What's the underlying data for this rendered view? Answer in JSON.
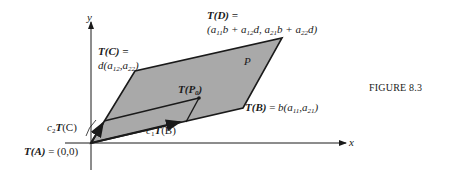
{
  "figure": {
    "caption": "FIGURE 8.3",
    "axes": {
      "x_label": "x",
      "y_label": "y"
    },
    "region_label": "P",
    "colors": {
      "fill": "#a9a9a9",
      "stroke": "#1a1a1a",
      "background": "#ffffff"
    },
    "labels": {
      "TD_line1": "T(D) =",
      "TD_line2": "(a11b + a12d, a21b + a22d)",
      "TC_line1": "T(C) =",
      "TC_line2": "d(a12,a22)",
      "TP0": "T(P0)",
      "TB": "T(B) = b(a11,a21)",
      "c1TB": "c1T(B)",
      "c2TC": "c2T(C)",
      "TA": "T(A) = (0,0)"
    }
  }
}
